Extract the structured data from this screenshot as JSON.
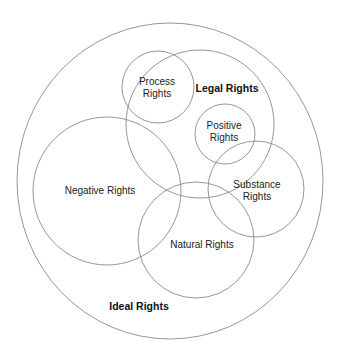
{
  "diagram": {
    "type": "venn",
    "stroke_color": "#8a8a8a",
    "text_color": "#222222",
    "sets": [
      {
        "id": "ideal",
        "label_lines": [
          "Ideal Rights"
        ],
        "bold": true
      },
      {
        "id": "legal",
        "label_lines": [
          "Legal Rights"
        ],
        "bold": true
      },
      {
        "id": "process",
        "label_lines": [
          "Process",
          "Rights"
        ],
        "bold": false
      },
      {
        "id": "positive",
        "label_lines": [
          "Positive",
          "Rights"
        ],
        "bold": false
      },
      {
        "id": "substance",
        "label_lines": [
          "Substance",
          "Rights"
        ],
        "bold": false
      },
      {
        "id": "negative",
        "label_lines": [
          "Negative Rights"
        ],
        "bold": false
      },
      {
        "id": "natural",
        "label_lines": [
          "Natural Rights"
        ],
        "bold": false
      }
    ]
  }
}
